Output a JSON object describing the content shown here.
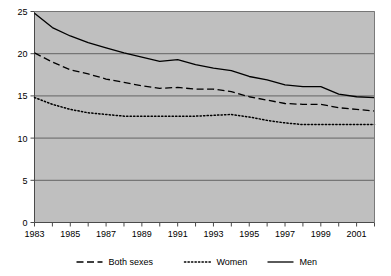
{
  "chart_data": {
    "type": "line",
    "title": "",
    "subtitle": "",
    "xlabel": "",
    "ylabel": "",
    "xlim": [
      1983,
      2002
    ],
    "ylim": [
      0,
      25
    ],
    "yticks": [
      0,
      5,
      10,
      15,
      20,
      25
    ],
    "ytick_labels": [
      "0",
      "5",
      "10",
      "15",
      "20",
      "25"
    ],
    "xticks": [
      1983,
      1984,
      1985,
      1986,
      1987,
      1988,
      1989,
      1990,
      1991,
      1992,
      1993,
      1994,
      1995,
      1996,
      1997,
      1998,
      1999,
      2000,
      2001,
      2002
    ],
    "xtick_labels": [
      "1983",
      "",
      "1985",
      "",
      "1987",
      "",
      "1989",
      "",
      "1991",
      "",
      "1993",
      "",
      "1995",
      "",
      "1997",
      "",
      "1999",
      "",
      "2001",
      ""
    ],
    "grid": "horizontal",
    "legend_position": "bottom",
    "plot_background": "#bfbfbf",
    "line_color": "#000000",
    "x": [
      1983,
      1984,
      1985,
      1986,
      1987,
      1988,
      1989,
      1990,
      1991,
      1992,
      1993,
      1994,
      1995,
      1996,
      1997,
      1998,
      1999,
      2000,
      2001,
      2002
    ],
    "series": [
      {
        "name": "Both sexes",
        "style": "dashed",
        "values": [
          20.1,
          19.0,
          18.1,
          17.6,
          17.0,
          16.6,
          16.2,
          15.9,
          16.0,
          15.8,
          15.8,
          15.5,
          14.9,
          14.5,
          14.1,
          14.0,
          14.0,
          13.6,
          13.4,
          13.2
        ]
      },
      {
        "name": "Women",
        "style": "dotted",
        "values": [
          14.8,
          14.0,
          13.4,
          13.0,
          12.8,
          12.6,
          12.6,
          12.6,
          12.6,
          12.6,
          12.7,
          12.8,
          12.5,
          12.1,
          11.8,
          11.6,
          11.6,
          11.6,
          11.6,
          11.6
        ]
      },
      {
        "name": "Men",
        "style": "solid",
        "values": [
          24.8,
          23.1,
          22.1,
          21.3,
          20.7,
          20.1,
          19.6,
          19.1,
          19.3,
          18.7,
          18.3,
          18.0,
          17.3,
          16.9,
          16.3,
          16.1,
          16.1,
          15.2,
          14.9,
          14.8
        ]
      }
    ],
    "legend": [
      {
        "label": "Both sexes",
        "style": "dashed"
      },
      {
        "label": "Women",
        "style": "dotted"
      },
      {
        "label": "Men",
        "style": "solid"
      }
    ]
  }
}
